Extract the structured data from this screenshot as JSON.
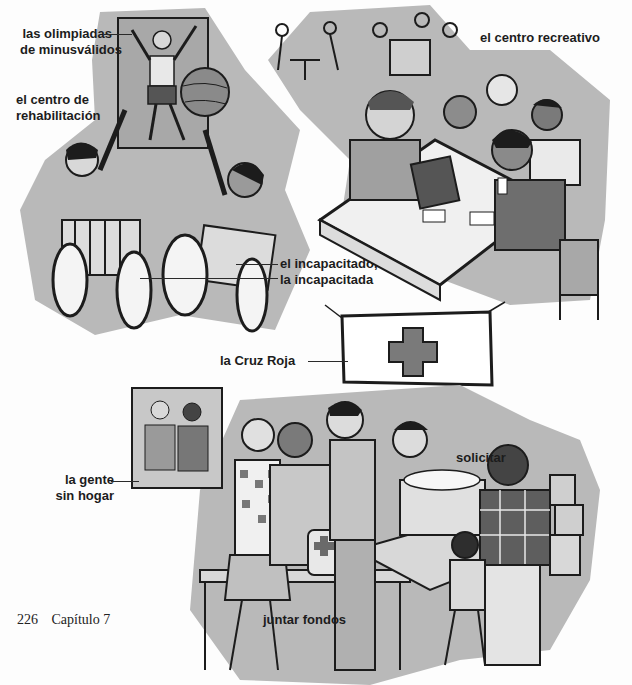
{
  "page": {
    "top_clipped_text": "· · · · · · · · · · · ·",
    "footer": {
      "page_number": "226",
      "chapter": "Capítulo 7"
    }
  },
  "colors": {
    "background": "#fdfdfd",
    "shape_gray": "#b9b9b9",
    "shape_dark": "#8e8e8e",
    "ink": "#1c1c1c",
    "cross": "#7a7a7a"
  },
  "scenes": [
    {
      "id": "rehab",
      "labels": {
        "olympics": [
          "las olimpiadas",
          "de minusválidos"
        ],
        "rehab_center": [
          "el centro de",
          "rehabilitación"
        ],
        "disabled": [
          "el incapacitado,",
          "la incapacitada"
        ]
      }
    },
    {
      "id": "recreation",
      "labels": {
        "rec_center": "el centro recreativo"
      }
    },
    {
      "id": "red-cross",
      "labels": {
        "red_cross": "la Cruz Roja",
        "homeless": [
          "la gente",
          "sin hogar"
        ],
        "solicit": "solicitar",
        "fundraise": "juntar fondos"
      }
    }
  ]
}
